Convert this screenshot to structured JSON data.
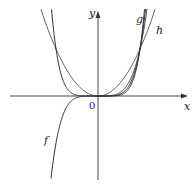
{
  "chart_data": {
    "type": "line",
    "title": "",
    "xlabel": "x",
    "ylabel": "y",
    "origin_label": "0",
    "grid": false,
    "series": [
      {
        "name": "f",
        "description": "odd power function (e.g. x^5), passes through (0,0) and (1,1), negative for x<0"
      },
      {
        "name": "g",
        "description": "higher even power (e.g. x^6), through (0,0),(±1,1), flat near origin"
      },
      {
        "name": "h",
        "description": "lower even power (e.g. x^2), parabola through (0,0),(±1,1)"
      }
    ],
    "annotations": [
      "f",
      "g",
      "h"
    ]
  },
  "labels": {
    "x": "x",
    "y": "y",
    "origin": "0",
    "f": "f",
    "g": "g",
    "h": "h"
  }
}
